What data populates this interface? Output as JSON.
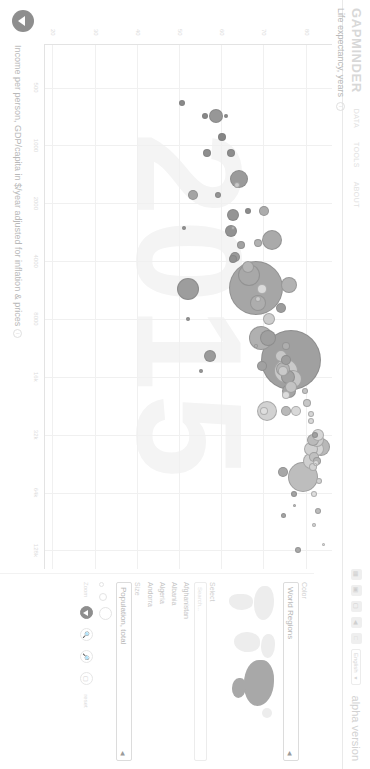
{
  "header": {
    "logo": "GAPMINDER",
    "nav": [
      "DATA",
      "TOOLS",
      "ABOUT"
    ],
    "icons": [
      "grid-icon",
      "save-icon",
      "image-icon",
      "share-icon",
      "fullscreen-icon"
    ],
    "language": "English",
    "language_caret": "▼",
    "version_note": "alpha version"
  },
  "chart_data": {
    "type": "scatter",
    "title": "",
    "xlabel": "Income per person, GDP/capita in $/year adjusted for inflation & prices",
    "ylabel": "Life expectancy, years",
    "xscale": "log",
    "xticks": [
      "500",
      "1000",
      "2000",
      "4000",
      "8000",
      "16k",
      "32k",
      "64k",
      "128k"
    ],
    "xtick_values": [
      500,
      1000,
      2000,
      4000,
      8000,
      16000,
      32000,
      64000,
      128000
    ],
    "yticks": [
      "20",
      "30",
      "40",
      "50",
      "60",
      "70",
      "80"
    ],
    "ytick_values": [
      20,
      30,
      40,
      50,
      60,
      70,
      80
    ],
    "xlim": [
      300,
      160000
    ],
    "ylim": [
      18,
      86
    ],
    "grid": true,
    "legend": "none",
    "watermark_year": "2015",
    "size_encoding": "Population, total",
    "color_encoding": "World Regions",
    "bubbles": [
      {
        "name": "China",
        "x": 13000,
        "y": 76.2,
        "r": 30,
        "fill": "#a0a0a0"
      },
      {
        "name": "India",
        "x": 5500,
        "y": 68.0,
        "r": 27,
        "fill": "#a6a6a6"
      },
      {
        "name": "United States",
        "x": 53000,
        "y": 79.1,
        "r": 15,
        "fill": "#bdbdbd"
      },
      {
        "name": "Indonesia",
        "x": 10000,
        "y": 69.1,
        "r": 12,
        "fill": "#b0b0b0"
      },
      {
        "name": "Brazil",
        "x": 15000,
        "y": 75.0,
        "r": 12,
        "fill": "#c9c9c9"
      },
      {
        "name": "Pakistan",
        "x": 4700,
        "y": 66.4,
        "r": 11,
        "fill": "#a8a8a8"
      },
      {
        "name": "Nigeria",
        "x": 5600,
        "y": 52.0,
        "r": 11,
        "fill": "#9d9d9d"
      },
      {
        "name": "Bangladesh",
        "x": 3100,
        "y": 71.8,
        "r": 10,
        "fill": "#aaaaaa"
      },
      {
        "name": "Russia",
        "x": 24000,
        "y": 70.5,
        "r": 10,
        "fill": "#d2d2d2"
      },
      {
        "name": "Japan",
        "x": 37000,
        "y": 83.5,
        "r": 9,
        "fill": "#b8b8b8"
      },
      {
        "name": "Mexico",
        "x": 16500,
        "y": 76.8,
        "r": 9,
        "fill": "#c5c5c5"
      },
      {
        "name": "Ethiopia",
        "x": 1500,
        "y": 64.0,
        "r": 9,
        "fill": "#9a9a9a"
      },
      {
        "name": "Philippines",
        "x": 6600,
        "y": 68.5,
        "r": 8,
        "fill": "#adadad"
      },
      {
        "name": "Egypt",
        "x": 10000,
        "y": 70.9,
        "r": 8,
        "fill": "#9f9f9f"
      },
      {
        "name": "Vietnam",
        "x": 5300,
        "y": 75.8,
        "r": 8,
        "fill": "#b2b2b2"
      },
      {
        "name": "Germany",
        "x": 44000,
        "y": 81.0,
        "r": 8,
        "fill": "#cfcfcf"
      },
      {
        "name": "Iran",
        "x": 16000,
        "y": 75.5,
        "r": 7,
        "fill": "#a3a3a3"
      },
      {
        "name": "Turkey",
        "x": 19000,
        "y": 75.9,
        "r": 7,
        "fill": "#a5a5a5"
      },
      {
        "name": "Congo Dem. Rep.",
        "x": 700,
        "y": 58.5,
        "r": 7,
        "fill": "#979797"
      },
      {
        "name": "Thailand",
        "x": 14500,
        "y": 74.5,
        "r": 7,
        "fill": "#b4b4b4"
      },
      {
        "name": "France",
        "x": 38000,
        "y": 82.4,
        "r": 7,
        "fill": "#d4d4d4"
      },
      {
        "name": "United Kingdom",
        "x": 38000,
        "y": 81.0,
        "r": 7,
        "fill": "#d0d0d0"
      },
      {
        "name": "Italy",
        "x": 34000,
        "y": 82.5,
        "r": 7,
        "fill": "#cdcdcd"
      },
      {
        "name": "South Africa",
        "x": 12500,
        "y": 57.0,
        "r": 6,
        "fill": "#9b9b9b"
      },
      {
        "name": "Myanmar",
        "x": 4300,
        "y": 66.0,
        "r": 6,
        "fill": "#b6b6b6"
      },
      {
        "name": "South Korea",
        "x": 34000,
        "y": 81.5,
        "r": 6,
        "fill": "#bababa"
      },
      {
        "name": "Colombia",
        "x": 12500,
        "y": 74.0,
        "r": 6,
        "fill": "#c7c7c7"
      },
      {
        "name": "Spain",
        "x": 32000,
        "y": 82.8,
        "r": 6,
        "fill": "#d6d6d6"
      },
      {
        "name": "Ukraine",
        "x": 8000,
        "y": 71.0,
        "r": 6,
        "fill": "#cccccc"
      },
      {
        "name": "Tanzania",
        "x": 2300,
        "y": 62.5,
        "r": 6,
        "fill": "#959595"
      },
      {
        "name": "Kenya",
        "x": 2800,
        "y": 62.0,
        "r": 6,
        "fill": "#929292"
      },
      {
        "name": "Argentina",
        "x": 18000,
        "y": 76.3,
        "r": 6,
        "fill": "#c3c3c3"
      },
      {
        "name": "Algeria",
        "x": 13000,
        "y": 75.2,
        "r": 5,
        "fill": "#9e9e9e"
      },
      {
        "name": "Sudan",
        "x": 3800,
        "y": 63.0,
        "r": 5,
        "fill": "#999999"
      },
      {
        "name": "Poland",
        "x": 24000,
        "y": 77.5,
        "r": 5,
        "fill": "#d8d8d8"
      },
      {
        "name": "Canada",
        "x": 42000,
        "y": 81.8,
        "r": 5,
        "fill": "#c0c0c0"
      },
      {
        "name": "Morocco",
        "x": 7000,
        "y": 74.0,
        "r": 5,
        "fill": "#9c9c9c"
      },
      {
        "name": "Iraq",
        "x": 14000,
        "y": 69.5,
        "r": 5,
        "fill": "#a1a1a1"
      },
      {
        "name": "Afghanistan",
        "x": 1800,
        "y": 53.0,
        "r": 5,
        "fill": "#a4a4a4"
      },
      {
        "name": "Saudi Arabia",
        "x": 50000,
        "y": 74.5,
        "r": 5,
        "fill": "#a7a7a7"
      },
      {
        "name": "Uzbekistan",
        "x": 5600,
        "y": 69.5,
        "r": 5,
        "fill": "#dadada"
      },
      {
        "name": "Malaysia",
        "x": 24000,
        "y": 75.0,
        "r": 5,
        "fill": "#b9b9b9"
      },
      {
        "name": "Nepal",
        "x": 2200,
        "y": 69.8,
        "r": 5,
        "fill": "#acacac"
      },
      {
        "name": "Venezuela",
        "x": 15000,
        "y": 74.5,
        "r": 5,
        "fill": "#cacaca"
      },
      {
        "name": "Ghana",
        "x": 3900,
        "y": 62.5,
        "r": 4,
        "fill": "#909090"
      },
      {
        "name": "Yemen",
        "x": 3300,
        "y": 64.5,
        "r": 4,
        "fill": "#a2a2a2"
      },
      {
        "name": "Mozambique",
        "x": 1100,
        "y": 56.5,
        "r": 4,
        "fill": "#8e8e8e"
      },
      {
        "name": "Australia",
        "x": 44000,
        "y": 82.4,
        "r": 4,
        "fill": "#b5b5b5"
      },
      {
        "name": "Sri Lanka",
        "x": 11000,
        "y": 75.0,
        "r": 4,
        "fill": "#aeaeae"
      },
      {
        "name": "Romania",
        "x": 20000,
        "y": 75.0,
        "r": 4,
        "fill": "#dcdcdc"
      },
      {
        "name": "Chile",
        "x": 22000,
        "y": 80.0,
        "r": 4,
        "fill": "#c6c6c6"
      },
      {
        "name": "Netherlands",
        "x": 47000,
        "y": 81.5,
        "r": 4,
        "fill": "#d1d1d1"
      },
      {
        "name": "Kazakhstan",
        "x": 24000,
        "y": 70.0,
        "r": 4,
        "fill": "#dedede"
      },
      {
        "name": "Cambodia",
        "x": 3200,
        "y": 68.5,
        "r": 4,
        "fill": "#b1b1b1"
      },
      {
        "name": "Zimbabwe",
        "x": 1800,
        "y": 59.0,
        "r": 3,
        "fill": "#949494"
      },
      {
        "name": "Senegal",
        "x": 2200,
        "y": 66.0,
        "r": 3,
        "fill": "#8c8c8c"
      },
      {
        "name": "Norway",
        "x": 65000,
        "y": 81.8,
        "r": 3,
        "fill": "#dfdfdf"
      },
      {
        "name": "Singapore",
        "x": 80000,
        "y": 82.6,
        "r": 3,
        "fill": "#bcbcbc"
      },
      {
        "name": "Switzerland",
        "x": 56000,
        "y": 83.0,
        "r": 3,
        "fill": "#d3d3d3"
      },
      {
        "name": "Qatar",
        "x": 128000,
        "y": 78.0,
        "r": 3,
        "fill": "#a9a9a9"
      },
      {
        "name": "Luxembourg",
        "x": 95000,
        "y": 81.8,
        "r": 2,
        "fill": "#d5d5d5"
      },
      {
        "name": "Central African Rep.",
        "x": 600,
        "y": 50.5,
        "r": 3,
        "fill": "#8a8a8a"
      },
      {
        "name": "Burundi",
        "x": 700,
        "y": 56.0,
        "r": 3,
        "fill": "#888888"
      },
      {
        "name": "Niger",
        "x": 900,
        "y": 60.0,
        "r": 4,
        "fill": "#868686"
      },
      {
        "name": "Liberia",
        "x": 700,
        "y": 61.0,
        "r": 2,
        "fill": "#8b8b8b"
      },
      {
        "name": "Malawi",
        "x": 1100,
        "y": 62.0,
        "r": 4,
        "fill": "#8d8d8d"
      },
      {
        "name": "Lesotho",
        "x": 2700,
        "y": 51.0,
        "r": 2,
        "fill": "#919191"
      },
      {
        "name": "Swaziland",
        "x": 8000,
        "y": 52.0,
        "r": 2,
        "fill": "#939393"
      },
      {
        "name": "Botswana",
        "x": 15000,
        "y": 55.0,
        "r": 2,
        "fill": "#969696"
      },
      {
        "name": "Haiti",
        "x": 1600,
        "y": 63.5,
        "r": 3,
        "fill": "#c8c8c8"
      },
      {
        "name": "Bolivia",
        "x": 6300,
        "y": 68.5,
        "r": 3,
        "fill": "#cbcbcb"
      },
      {
        "name": "Cuba",
        "x": 19000,
        "y": 79.5,
        "r": 3,
        "fill": "#c4c4c4"
      },
      {
        "name": "Greece",
        "x": 25000,
        "y": 81.0,
        "r": 3,
        "fill": "#d7d7d7"
      },
      {
        "name": "Portugal",
        "x": 27000,
        "y": 81.0,
        "r": 3,
        "fill": "#d9d9d9"
      },
      {
        "name": "Sweden",
        "x": 45000,
        "y": 82.2,
        "r": 3,
        "fill": "#dbdbdb"
      },
      {
        "name": "Israel",
        "x": 32000,
        "y": 82.0,
        "r": 3,
        "fill": "#a0a0a0"
      },
      {
        "name": "Mongolia",
        "x": 11000,
        "y": 68.0,
        "r": 2,
        "fill": "#b3b3b3"
      },
      {
        "name": "Papua New Guinea",
        "x": 2700,
        "y": 62.5,
        "r": 2,
        "fill": "#b7b7b7"
      },
      {
        "name": "Andorra",
        "x": 46000,
        "y": 82.0,
        "r": 1.5,
        "fill": "#e0e0e0"
      },
      {
        "name": "Monaco",
        "x": 120000,
        "y": 84.0,
        "r": 1.5,
        "fill": "#e1e1e1"
      },
      {
        "name": "Brunei",
        "x": 75000,
        "y": 77.0,
        "r": 1.5,
        "fill": "#bebebe"
      },
      {
        "name": "Kuwait",
        "x": 84000,
        "y": 74.5,
        "r": 2.5,
        "fill": "#a5a5a5"
      },
      {
        "name": "United Arab Emirates",
        "x": 65000,
        "y": 77.0,
        "r": 3,
        "fill": "#a3a3a3"
      }
    ]
  },
  "panel": {
    "color": {
      "label": "Color",
      "value": "World Regions",
      "caret": "◀"
    },
    "select": {
      "label": "Select",
      "search_placeholder": "Search...",
      "countries": [
        "Afghanistan",
        "Albania",
        "Algeria",
        "Andorra"
      ]
    },
    "size": {
      "label": "Size",
      "value": "Population, total",
      "caret": "◀"
    },
    "zoom": {
      "label": "Zoom",
      "buttons": [
        "pan-hand-icon",
        "zoom-in-icon",
        "zoom-out-icon",
        "reset-icon"
      ],
      "reset_label": "reset"
    }
  }
}
